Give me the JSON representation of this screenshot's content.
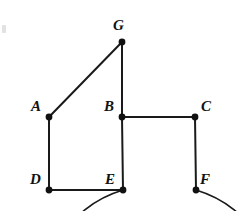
{
  "figure": {
    "stroke_color": "#1a1a1a",
    "vertex_color": "#111111",
    "background_color": "#ffffff",
    "width": 240,
    "height": 211
  },
  "chart_data": {
    "type": "diagram",
    "title": "",
    "vertices": [
      {
        "id": "G",
        "label": "G",
        "x": 122,
        "y": 42,
        "label_x": 113,
        "label_y": 18
      },
      {
        "id": "A",
        "label": "A",
        "x": 49,
        "y": 117,
        "label_x": 31,
        "label_y": 99
      },
      {
        "id": "B",
        "label": "B",
        "x": 122,
        "y": 117,
        "label_x": 104,
        "label_y": 99
      },
      {
        "id": "C",
        "label": "C",
        "x": 195,
        "y": 117,
        "label_x": 201,
        "label_y": 99
      },
      {
        "id": "D",
        "label": "D",
        "x": 49,
        "y": 190,
        "label_x": 30,
        "label_y": 172
      },
      {
        "id": "E",
        "label": "E",
        "x": 123,
        "y": 190,
        "label_x": 105,
        "label_y": 172
      },
      {
        "id": "F",
        "label": "F",
        "x": 196,
        "y": 190,
        "label_x": 200,
        "label_y": 172
      }
    ],
    "edges": [
      {
        "from": "G",
        "to": "A"
      },
      {
        "from": "G",
        "to": "B"
      },
      {
        "from": "B",
        "to": "C"
      },
      {
        "from": "A",
        "to": "D"
      },
      {
        "from": "D",
        "to": "E"
      },
      {
        "from": "B",
        "to": "E"
      },
      {
        "from": "C",
        "to": "F"
      }
    ],
    "arc": {
      "description": "circle through G passing left of A and D, bottom below D-E, ending at E; right side from G down to F",
      "center_x": 122,
      "center_y": 124,
      "radius_x": 104,
      "radius_y": 83,
      "start_vertex": "E",
      "end_vertex": "F",
      "gap_between": [
        "E",
        "F"
      ]
    }
  }
}
